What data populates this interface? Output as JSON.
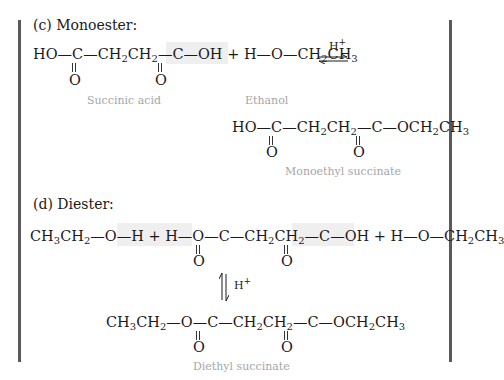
{
  "section_c": {
    "heading": "(c)  Monoester:",
    "reactant_acid": {
      "parts": [
        "HO—C—CH",
        "2",
        "CH",
        "2",
        "—C—OH"
      ],
      "carbonyl_oxygen": "O",
      "label": "Succinic acid"
    },
    "plus": "+",
    "reactant_alcohol": {
      "parts": [
        "H—O—CH",
        "2",
        "CH",
        "3"
      ],
      "label": "Ethanol"
    },
    "catalyst": "H",
    "catalyst_charge": "+",
    "arrow": "equilibrium",
    "product": {
      "parts": [
        "HO—C—CH",
        "2",
        "CH",
        "2",
        "—C—OCH",
        "2",
        "CH",
        "3"
      ],
      "carbonyl_oxygen": "O",
      "label": "Monoethyl succinate"
    }
  },
  "section_d": {
    "heading": "(d)  Diester:",
    "reactants": {
      "left_alcohol": [
        "CH",
        "3",
        "CH",
        "2",
        "—O—H"
      ],
      "plus": "+",
      "acid": [
        "H—O—C—CH",
        "2",
        "CH",
        "2",
        "—C—OH"
      ],
      "right_alcohol": [
        "H—O—CH",
        "2",
        "CH",
        "3"
      ],
      "carbonyl_oxygen": "O"
    },
    "catalyst": "H",
    "catalyst_charge": "+",
    "arrow": "equilibrium-vertical",
    "product": {
      "parts": [
        "CH",
        "3",
        "CH",
        "2",
        "—O—C—CH",
        "2",
        "CH",
        "2",
        "—C—OCH",
        "2",
        "CH",
        "3"
      ],
      "carbonyl_oxygen": "O",
      "label": "Diethyl succinate"
    }
  },
  "colors": {
    "text": "#1a1a1a",
    "label": "#a6a6a6",
    "border_bar": "#5a5a5a",
    "highlight": "#efefef"
  }
}
